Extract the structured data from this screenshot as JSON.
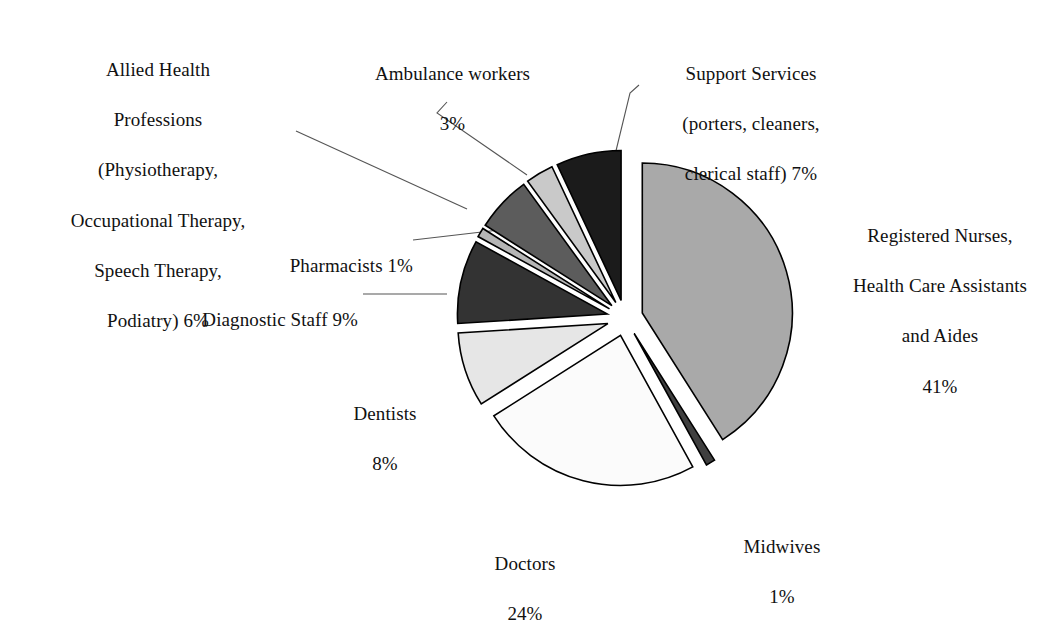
{
  "chart_data": {
    "type": "pie",
    "title": "",
    "subtitle": "",
    "xlabel": "",
    "ylabel": "",
    "legend_position": "none",
    "grid": false,
    "units": "percent",
    "total": 100,
    "categories": [
      "Registered Nurses, Health Care Assistants and Aides",
      "Midwives",
      "Doctors",
      "Dentists",
      "Diagnostic Staff",
      "Pharmacists",
      "Allied Health Professions (Physiotherapy, Occupational Therapy, Speech Therapy, Podiatry)",
      "Ambulance workers",
      "Support Services (porters, cleaners, clerical staff)"
    ],
    "values": [
      41,
      1,
      24,
      8,
      9,
      1,
      6,
      3,
      7
    ],
    "slices": [
      {
        "key": "registered-nurses",
        "name": "Registered Nurses, Health Care Assistants and Aides",
        "value": 41,
        "percent_label": "41%",
        "color": "#a9a9a9",
        "start_angle": 0,
        "end_angle": 147.6,
        "explode": 18
      },
      {
        "key": "midwives",
        "name": "Midwives",
        "value": 1,
        "percent_label": "1%",
        "color": "#3f3f3f",
        "start_angle": 147.6,
        "end_angle": 151.2,
        "explode": 18
      },
      {
        "key": "doctors",
        "name": "Doctors",
        "value": 24,
        "percent_label": "24%",
        "color": "#fbfbfb",
        "start_angle": 151.2,
        "end_angle": 237.6,
        "explode": 18
      },
      {
        "key": "dentists",
        "name": "Dentists",
        "value": 8,
        "percent_label": "8%",
        "color": "#e6e6e6",
        "start_angle": 237.6,
        "end_angle": 266.4,
        "explode": 18
      },
      {
        "key": "diagnostic-staff",
        "name": "Diagnostic Staff",
        "value": 9,
        "percent_label": "9%",
        "color": "#333333",
        "start_angle": 266.4,
        "end_angle": 298.8,
        "explode": 18
      },
      {
        "key": "pharmacists",
        "name": "Pharmacists",
        "value": 1,
        "percent_label": "1%",
        "color": "#b5b5b5",
        "start_angle": 298.8,
        "end_angle": 302.4,
        "explode": 18
      },
      {
        "key": "allied-health-professions",
        "name": "Allied Health Professions (Physiotherapy, Occupational Therapy, Speech Therapy, Podiatry)",
        "value": 6,
        "percent_label": "6%",
        "color": "#5c5c5c",
        "start_angle": 302.4,
        "end_angle": 324.0,
        "explode": 18
      },
      {
        "key": "ambulance-workers",
        "name": "Ambulance workers",
        "value": 3,
        "percent_label": "3%",
        "color": "#c9c9c9",
        "start_angle": 324.0,
        "end_angle": 334.8,
        "explode": 18
      },
      {
        "key": "support-services",
        "name": "Support Services (porters, cleaners, clerical staff)",
        "value": 7,
        "percent_label": "7%",
        "color": "#1b1b1b",
        "start_angle": 334.8,
        "end_angle": 360,
        "explode": 18
      }
    ],
    "geometry": {
      "center_x": 625,
      "center_y": 318,
      "radius": 150,
      "stroke": "#000000",
      "stroke_width": 1.6,
      "background": "#ffffff"
    }
  },
  "labels": {
    "registered_nurses": {
      "line1": "Registered Nurses,",
      "line2": "Health Care Assistants",
      "line3": "and Aides",
      "line4": "41%"
    },
    "support_services": {
      "line1": "Support Services",
      "line2": "(porters, cleaners,",
      "line3": "clerical staff) 7%"
    },
    "ambulance_workers": {
      "line1": "Ambulance workers",
      "line2": "3%"
    },
    "allied_health": {
      "line1": "Allied Health",
      "line2": "Professions",
      "line3": "(Physiotherapy,",
      "line4": "Occupational Therapy,",
      "line5": "Speech Therapy,",
      "line6": "Podiatry)  6%"
    },
    "pharmacists": {
      "line1": "Pharmacists  1%"
    },
    "diagnostic_staff": {
      "line1": "Diagnostic Staff 9%"
    },
    "dentists": {
      "line1": "Dentists",
      "line2": "8%"
    },
    "doctors": {
      "line1": "Doctors",
      "line2": "24%"
    },
    "midwives": {
      "line1": "Midwives",
      "line2": "1%"
    }
  }
}
